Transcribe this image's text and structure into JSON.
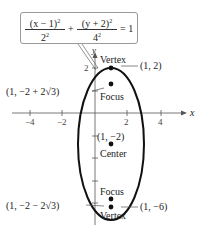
{
  "equation": {
    "term1_num": "(x − 1)",
    "term1_num_exp": "2",
    "term1_den": "2",
    "term1_den_exp": "2",
    "plus": "+",
    "term2_num": "(y + 2)",
    "term2_num_exp": "2",
    "term2_den": "4",
    "term2_den_exp": "2",
    "equals": "= 1"
  },
  "axes": {
    "x_label": "x",
    "y_label": "y",
    "x_ticks": [
      "−4",
      "−2",
      "2",
      "4"
    ],
    "y_ticks": [
      "2"
    ]
  },
  "points": {
    "top_vertex": {
      "label": "Vertex",
      "coord": "(1, 2)"
    },
    "top_focus": {
      "label": "Focus",
      "coord": "(1, −2 + 2√3)"
    },
    "center": {
      "label": "Center",
      "coord": "(1, −2)"
    },
    "bottom_focus": {
      "label": "Focus",
      "coord": "(1, −2 − 2√3)"
    },
    "bottom_vertex": {
      "label": "Vertex",
      "coord": "(1, −6)"
    }
  },
  "colors": {
    "curve": "#111111",
    "axis": "#555555",
    "box_border": "#999999"
  }
}
